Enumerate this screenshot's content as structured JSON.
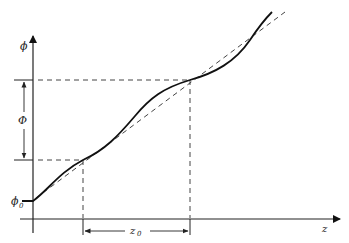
{
  "diagram": {
    "type": "phase-vs-position plot",
    "y_axis": {
      "label": "ϕ"
    },
    "x_axis": {
      "label": "z"
    },
    "annotations": {
      "phi0": "ϕ",
      "phi0_sub": "0",
      "Phi": "Φ",
      "z0": "z",
      "z0_sub": "0"
    },
    "series": [
      {
        "name": "oscillating phase curve",
        "style": "solid"
      },
      {
        "name": "mean linear trend",
        "style": "dashed"
      }
    ],
    "colors": {
      "line": "#111111",
      "dashed": "#444444",
      "axis": "#222222"
    }
  }
}
